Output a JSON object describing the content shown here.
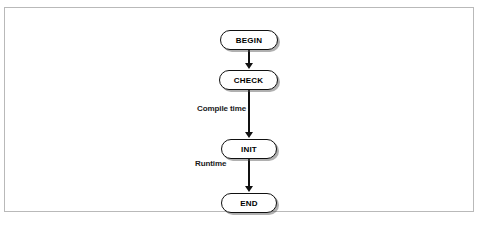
{
  "figure": {
    "background_color": "#ffffff",
    "frame_color": "#b9b9b9"
  },
  "bands": [
    {
      "id": "compile",
      "label": "Compile time",
      "fill_color": "#c4c4c4"
    },
    {
      "id": "runtime",
      "label": "Runtime",
      "fill_color": "#c4c4c4"
    }
  ],
  "nodes": [
    {
      "id": "begin",
      "label": "BEGIN",
      "phase": "compile"
    },
    {
      "id": "check",
      "label": "CHECK",
      "phase": "compile"
    },
    {
      "id": "init",
      "label": "INIT",
      "phase": "runtime"
    },
    {
      "id": "end",
      "label": "END",
      "phase": "none"
    }
  ],
  "connectors": [
    {
      "id": "begin-to-check",
      "from": "begin",
      "to": "check",
      "style": "arrow-down"
    },
    {
      "id": "check-to-init",
      "from": "check",
      "to": "init",
      "style": "arrow-down"
    },
    {
      "id": "init-to-end",
      "from": "init",
      "to": "end",
      "style": "arrow-down"
    }
  ]
}
